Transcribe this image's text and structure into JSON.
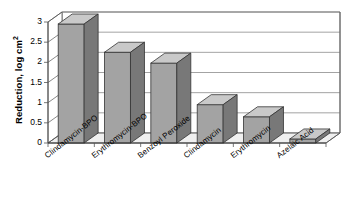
{
  "chart_data": {
    "type": "bar",
    "title": "",
    "subtitle": "",
    "xlabel": "",
    "ylabel": "Reduction, log cm",
    "ylabel_superscript": "2",
    "ylabel_full": "Reduction, log cm2",
    "categories": [
      "Clindamycin-BPO",
      "Erythromycin-BPO",
      "Benzoyl Peroxide",
      "Clindamycin",
      "Erythromycin",
      "Azelaic Acid"
    ],
    "values": [
      2.95,
      2.25,
      1.98,
      0.95,
      0.65,
      0.1
    ],
    "ylim": [
      0,
      3
    ],
    "ytick_values": [
      0,
      0.5,
      1,
      1.5,
      2,
      2.5,
      3
    ],
    "ytick_labels": [
      "0",
      "0.5",
      "1",
      "1.5",
      "2",
      "2.5",
      "3"
    ],
    "grid": true,
    "grid_axis": "y",
    "legend": false,
    "legend_position": "none",
    "three_d": true,
    "series": [
      {
        "name": "Reduction",
        "values": [
          2.95,
          2.25,
          1.98,
          0.95,
          0.65,
          0.1
        ]
      }
    ]
  },
  "style": {
    "bar_front_color": "#a3a3a3",
    "bar_side_color": "#787878",
    "bar_top_color": "#c9c9c9",
    "bar_edge_color": "#333333",
    "plot_background": "#ffffff",
    "grid_color": "#8c8c8c",
    "axis_color": "#555555",
    "floor_color": "#efefef",
    "text_color": "#000000"
  }
}
